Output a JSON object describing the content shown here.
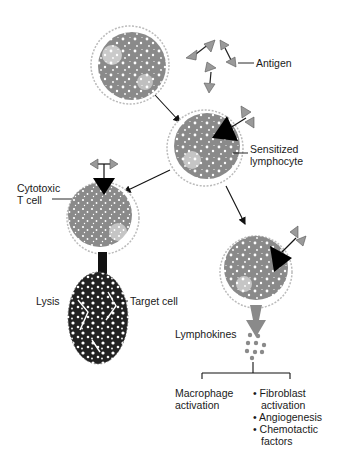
{
  "labels": {
    "antigen": "Antigen",
    "sensitized_line1": "Sensitized",
    "sensitized_line2": "lymphocyte",
    "cytotoxic_line1": "Cytotoxic",
    "cytotoxic_line2": "T cell",
    "lysis": "Lysis",
    "target_cell": "Target cell",
    "lymphokines": "Lymphokines",
    "macrophage_line1": "Macrophage",
    "macrophage_line2": "activation",
    "effects": [
      {
        "bullet": "•",
        "line1": "Fibroblast",
        "line2": "activation"
      },
      {
        "bullet": "•",
        "line1": "Angiogenesis",
        "line2": ""
      },
      {
        "bullet": "•",
        "line1": "Chemotactic",
        "line2": "factors"
      }
    ]
  },
  "colors": {
    "cell_gray": "#8a8a8a",
    "cell_outline": "#b8b8b8",
    "receptor_black": "#000000",
    "antigen_gray": "#9a9a9a",
    "target_dark": "#1a1a1a",
    "text": "#1a1a1a"
  }
}
